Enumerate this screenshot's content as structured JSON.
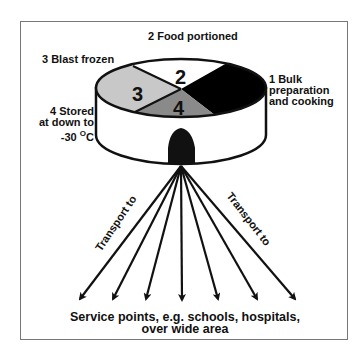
{
  "diagram": {
    "stages": [
      {
        "number": "1",
        "label_line1": "1 Bulk",
        "label_line2": "preparation",
        "label_line3": "and cooking",
        "fill": "#000000"
      },
      {
        "number": "2",
        "label": "2 Food portioned",
        "fill": "#ffffff"
      },
      {
        "number": "3",
        "label": "3 Blast frozen",
        "fill": "#c8c8c8"
      },
      {
        "number": "4",
        "label_line1": "4 Stored",
        "label_line2": "at down to",
        "label_line3": "-30 ",
        "label_unit_sup": "O",
        "label_unit": "C",
        "fill": "#8a8a8a"
      }
    ],
    "transport_left": "Transport to",
    "transport_right": "Transport to",
    "arrow_count": 7,
    "destination_line1": "Service points, e.g. schools, hospitals,",
    "destination_line2": "over wide area"
  }
}
